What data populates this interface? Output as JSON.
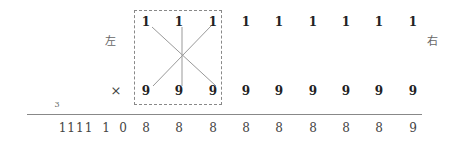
{
  "labels": {
    "left": "左",
    "right": "右",
    "times": "×",
    "carry": "3"
  },
  "top_row": [
    "1",
    "1",
    "1",
    "1",
    "1",
    "1",
    "1",
    "1",
    "1"
  ],
  "bottom_row": [
    "9",
    "9",
    "9",
    "9",
    "9",
    "9",
    "9",
    "9",
    "9"
  ],
  "result": {
    "prefix": [
      "1111",
      "1",
      "0"
    ],
    "digits": [
      "8",
      "8",
      "8",
      "8",
      "8",
      "8",
      "8",
      "8",
      "9"
    ]
  },
  "colors": {
    "line": "#888888",
    "text": "#222222"
  }
}
